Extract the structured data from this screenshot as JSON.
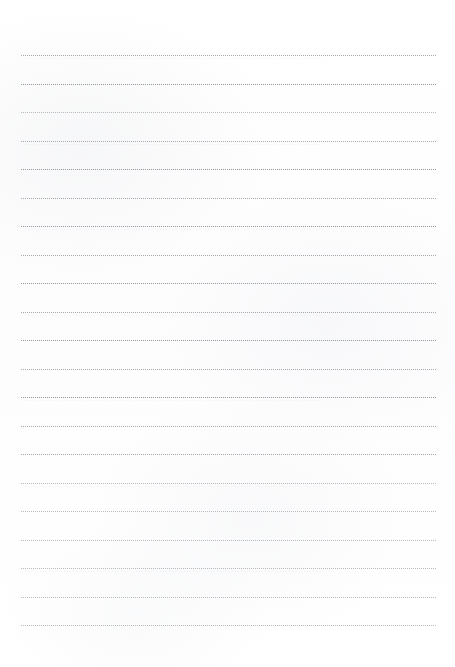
{
  "document": {
    "kind": "lined-writing-paper",
    "title": "",
    "page_width": 455,
    "page_height": 667,
    "background_color": "#ffffff",
    "content_text": "",
    "header_text": "",
    "footer_text": "",
    "page_number": ""
  },
  "rules": {
    "count": 21,
    "color": "#8c8f96",
    "style": "dotted",
    "thickness_px": 1,
    "dot_period_px": 2,
    "left_x": 21,
    "right_x": 436,
    "width_px": 415,
    "first_y": 55,
    "spacing_px": 28.5,
    "top_margin_px": 55,
    "bottom_margin_px": 42,
    "left_margin_px": 21,
    "right_margin_px": 19,
    "lines": [
      {
        "index": 1,
        "y": 55,
        "weight": "mid"
      },
      {
        "index": 2,
        "y": 84,
        "weight": "strong"
      },
      {
        "index": 3,
        "y": 112,
        "weight": "light"
      },
      {
        "index": 4,
        "y": 141,
        "weight": "mid"
      },
      {
        "index": 5,
        "y": 169,
        "weight": "strong"
      },
      {
        "index": 6,
        "y": 198,
        "weight": "mid"
      },
      {
        "index": 7,
        "y": 226,
        "weight": "strong"
      },
      {
        "index": 8,
        "y": 255,
        "weight": "mid"
      },
      {
        "index": 9,
        "y": 283,
        "weight": "strong"
      },
      {
        "index": 10,
        "y": 312,
        "weight": "mid"
      },
      {
        "index": 11,
        "y": 340,
        "weight": "strong"
      },
      {
        "index": 12,
        "y": 369,
        "weight": "mid"
      },
      {
        "index": 13,
        "y": 397,
        "weight": "strong"
      },
      {
        "index": 14,
        "y": 426,
        "weight": "mid"
      },
      {
        "index": 15,
        "y": 454,
        "weight": "mid"
      },
      {
        "index": 16,
        "y": 483,
        "weight": "light"
      },
      {
        "index": 17,
        "y": 511,
        "weight": "light"
      },
      {
        "index": 18,
        "y": 540,
        "weight": "light"
      },
      {
        "index": 19,
        "y": 568,
        "weight": "light"
      },
      {
        "index": 20,
        "y": 597,
        "weight": "light"
      },
      {
        "index": 21,
        "y": 625,
        "weight": "light"
      }
    ]
  }
}
